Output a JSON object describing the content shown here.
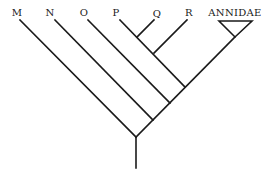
{
  "diagram": {
    "type": "cladogram",
    "taxa": [
      {
        "label": "M",
        "x": 16
      },
      {
        "label": "N",
        "x": 50
      },
      {
        "label": "O",
        "x": 84
      },
      {
        "label": "P",
        "x": 116
      },
      {
        "label": "Q",
        "x": 156
      },
      {
        "label": "R",
        "x": 189
      },
      {
        "label": "ANNIDAE",
        "x": 235
      }
    ],
    "colors": {
      "line": "#1a1a1a",
      "background": "#ffffff"
    }
  }
}
